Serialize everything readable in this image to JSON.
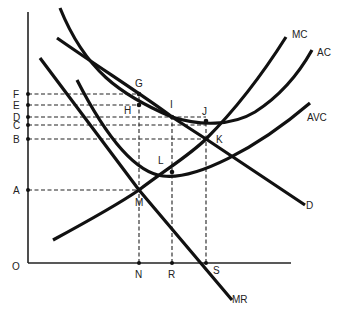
{
  "diagram": {
    "type": "economics-cost-revenue-diagram",
    "origin_label": "O",
    "y_axis_labels": [
      {
        "label": "F",
        "y": 94
      },
      {
        "label": "E",
        "y": 105
      },
      {
        "label": "D",
        "y": 117
      },
      {
        "label": "C",
        "y": 125
      },
      {
        "label": "B",
        "y": 139
      },
      {
        "label": "A",
        "y": 190
      }
    ],
    "x_axis_labels": [
      {
        "label": "N",
        "x": 139
      },
      {
        "label": "R",
        "x": 172
      },
      {
        "label": "S",
        "x": 206
      }
    ],
    "curves": [
      {
        "label": "MC",
        "description": "marginal cost"
      },
      {
        "label": "AC",
        "description": "average cost"
      },
      {
        "label": "AVC",
        "description": "average variable cost"
      },
      {
        "label": "D",
        "description": "demand"
      },
      {
        "label": "MR",
        "description": "marginal revenue"
      }
    ],
    "points": [
      {
        "label": "G",
        "x": 139,
        "y": 94
      },
      {
        "label": "H",
        "x": 139,
        "y": 105
      },
      {
        "label": "I",
        "x": 172,
        "y": 117
      },
      {
        "label": "J",
        "x": 206,
        "y": 121
      },
      {
        "label": "K",
        "x": 206,
        "y": 139
      },
      {
        "label": "L",
        "x": 172,
        "y": 172
      },
      {
        "label": "M",
        "x": 139,
        "y": 190
      }
    ]
  },
  "labels": {
    "O": "O",
    "F": "F",
    "E": "E",
    "D_axis": "D",
    "C": "C",
    "B": "B",
    "A": "A",
    "N": "N",
    "R": "R",
    "S": "S",
    "G": "G",
    "H": "H",
    "I": "I",
    "J": "J",
    "K": "K",
    "L": "L",
    "M": "M",
    "MC": "MC",
    "AC": "AC",
    "AVC": "AVC",
    "D_curve": "D",
    "MR": "MR"
  }
}
